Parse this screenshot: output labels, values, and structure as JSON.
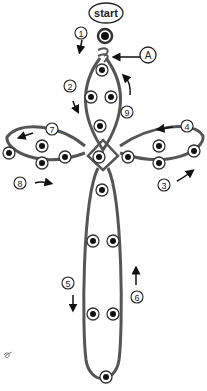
{
  "diagram": {
    "start_label": "start",
    "callout_label": "A",
    "steps": [
      {
        "number": "1",
        "x": 81,
        "y": 33
      },
      {
        "number": "2",
        "x": 70,
        "y": 86
      },
      {
        "number": "9",
        "x": 127,
        "y": 112
      },
      {
        "number": "7",
        "x": 52,
        "y": 129
      },
      {
        "number": "4",
        "x": 187,
        "y": 126
      },
      {
        "number": "8",
        "x": 20,
        "y": 183
      },
      {
        "number": "3",
        "x": 164,
        "y": 185
      },
      {
        "number": "5",
        "x": 68,
        "y": 283
      },
      {
        "number": "6",
        "x": 137,
        "y": 297
      }
    ],
    "colors": {
      "wire": "#555555",
      "bead_fill": "#111111",
      "bead_ring": "#333333",
      "background": "#ffffff"
    }
  }
}
